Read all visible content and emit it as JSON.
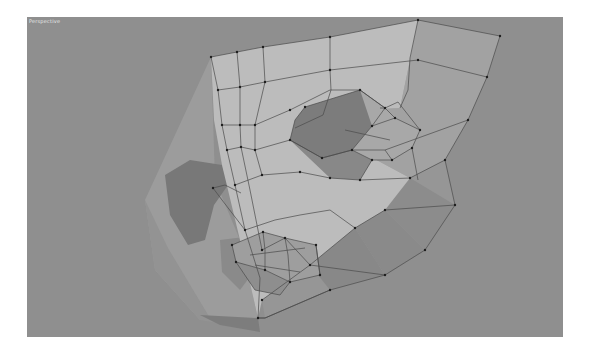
{
  "viewport": {
    "label": "Perspective",
    "background": "#8f8f8f"
  },
  "colors": {
    "face_light": "#bcbcbc",
    "face_mid": "#a5a5a5",
    "face_side": "#9b9b9b",
    "face_dark": "#7a7a7a",
    "face_shadow": "#6e6e6e",
    "edge": "#4a4a4a",
    "vertex": "#1e1e1e"
  }
}
